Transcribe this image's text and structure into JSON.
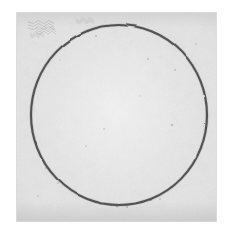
{
  "image": {
    "kind": "scanned-artwork",
    "subject": "hand-drawn circle on textured paper",
    "canvas_width": 233,
    "canvas_height": 237,
    "background_color": "#ffffff",
    "alt_text": "A hand-drawn dark circle outline centered on a square sheet of mottled light-gray paper, photographed against a white background."
  },
  "paper": {
    "name": "paper-sheet",
    "left": 16,
    "top": 12,
    "width": 201,
    "height": 210,
    "base_color": "#efefef",
    "highlight_color": "#f6f6f6",
    "shadow_color": "#e2e2e2",
    "edge_color": "#d6d6d6"
  },
  "circle": {
    "name": "drawn-circle",
    "center_x": 119,
    "center_y": 115,
    "radius_x": 88,
    "radius_y": 90,
    "stroke_color": "#2e2e2e",
    "stroke_width": 2.1,
    "style": "hand-drawn, slightly irregular, closed loop"
  },
  "marks": {
    "scribbles": [
      {
        "name": "scribble-upper-left-1",
        "x": 28,
        "y": 22,
        "width": 26,
        "height": 9,
        "opacity": 0.3
      },
      {
        "name": "scribble-upper-left-2",
        "x": 36,
        "y": 28,
        "width": 20,
        "height": 7,
        "opacity": 0.26
      },
      {
        "name": "scribble-upper-left-3",
        "x": 30,
        "y": 33,
        "width": 14,
        "height": 5,
        "opacity": 0.22
      },
      {
        "name": "scribble-upper-mid",
        "x": 76,
        "y": 19,
        "width": 18,
        "height": 5,
        "opacity": 0.2
      }
    ],
    "speckles": [
      {
        "x": 88,
        "y": 31,
        "r": 1.4,
        "opacity": 0.45
      },
      {
        "x": 96,
        "y": 36,
        "r": 1.0,
        "opacity": 0.35
      },
      {
        "x": 148,
        "y": 59,
        "r": 1.1,
        "opacity": 0.3
      },
      {
        "x": 175,
        "y": 70,
        "r": 1.0,
        "opacity": 0.28
      },
      {
        "x": 172,
        "y": 125,
        "r": 1.3,
        "opacity": 0.3
      },
      {
        "x": 104,
        "y": 129,
        "r": 0.9,
        "opacity": 0.25
      },
      {
        "x": 86,
        "y": 146,
        "r": 0.9,
        "opacity": 0.24
      },
      {
        "x": 46,
        "y": 168,
        "r": 1.1,
        "opacity": 0.28
      },
      {
        "x": 58,
        "y": 183,
        "r": 1.0,
        "opacity": 0.26
      },
      {
        "x": 117,
        "y": 206,
        "r": 1.5,
        "opacity": 0.4
      },
      {
        "x": 127,
        "y": 207,
        "r": 1.1,
        "opacity": 0.33
      },
      {
        "x": 160,
        "y": 199,
        "r": 1.0,
        "opacity": 0.27
      },
      {
        "x": 38,
        "y": 196,
        "r": 0.9,
        "opacity": 0.25
      },
      {
        "x": 196,
        "y": 44,
        "r": 0.9,
        "opacity": 0.24
      },
      {
        "x": 60,
        "y": 60,
        "r": 0.8,
        "opacity": 0.22
      },
      {
        "x": 140,
        "y": 96,
        "r": 0.8,
        "opacity": 0.2
      }
    ]
  },
  "chart_data": null
}
